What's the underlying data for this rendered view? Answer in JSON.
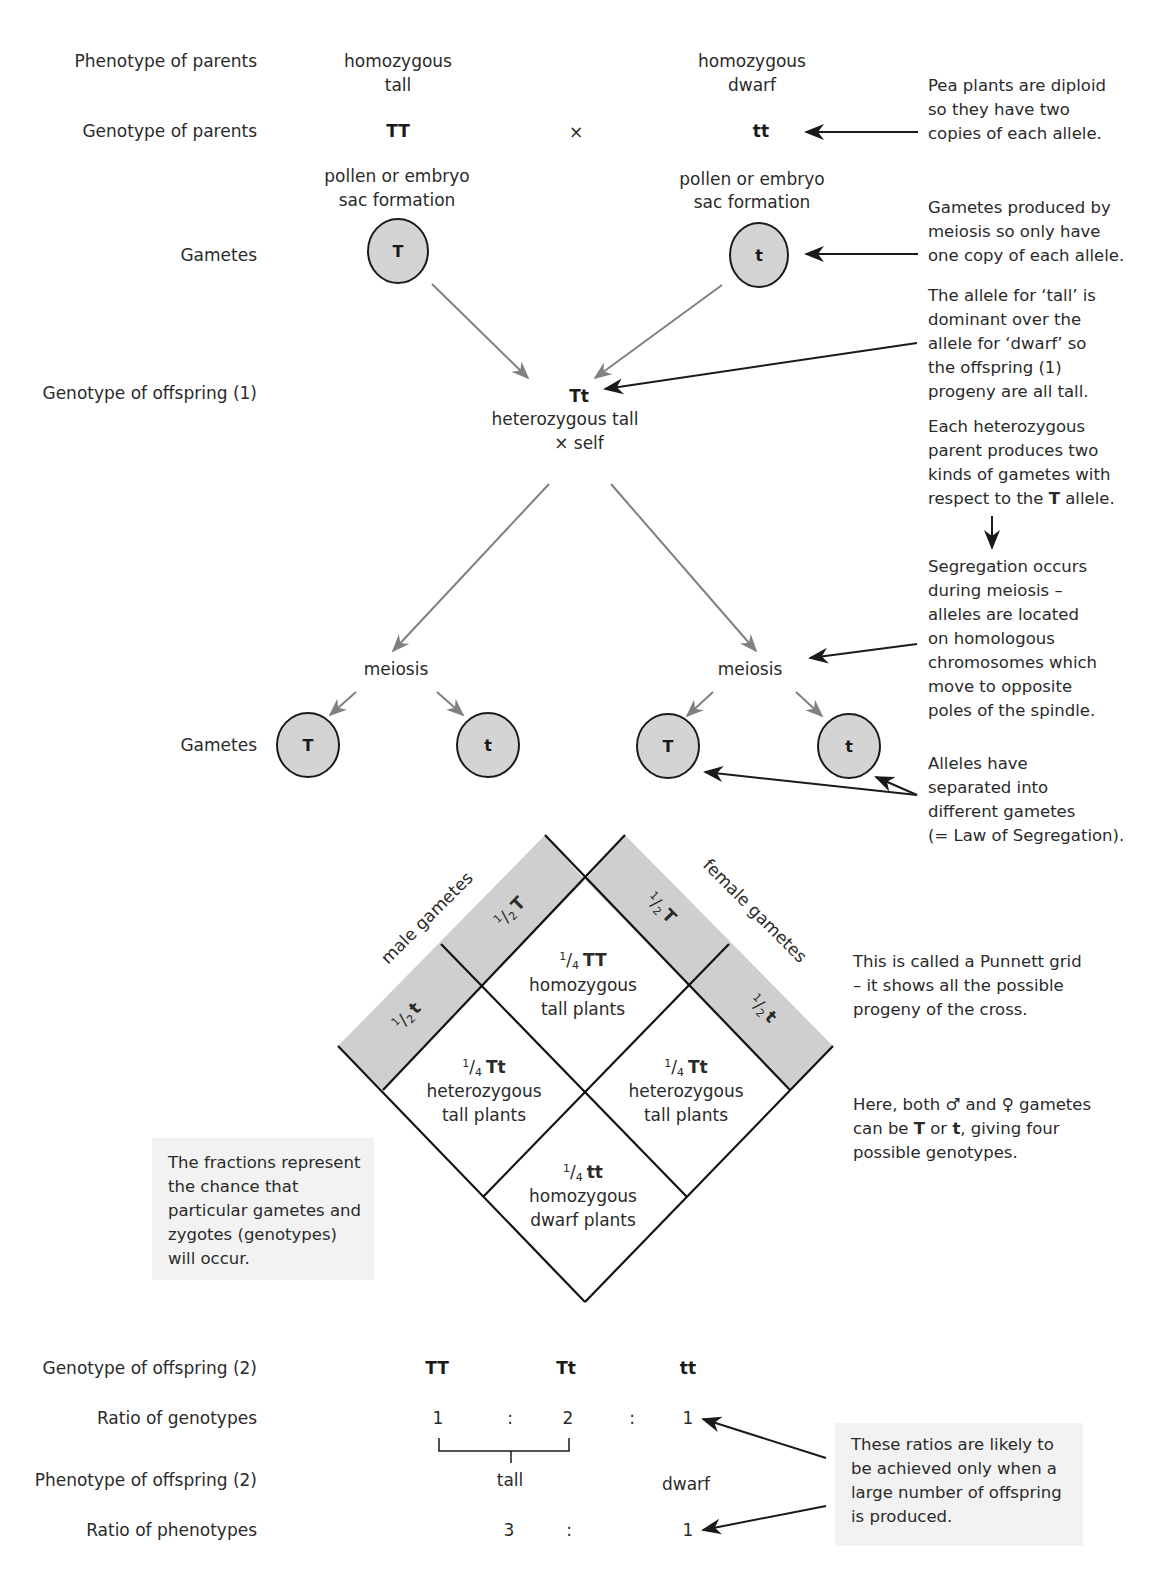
{
  "row_labels": {
    "phenotype_parents": "Phenotype of parents",
    "genotype_parents": "Genotype of parents",
    "gametes_1": "Gametes",
    "genotype_offspring_1": "Genotype of offspring (1)",
    "gametes_2": "Gametes",
    "genotype_offspring_2": "Genotype of offspring (2)",
    "ratio_genotypes": "Ratio of genotypes",
    "phenotype_offspring_2": "Phenotype of offspring (2)",
    "ratio_phenotypes": "Ratio of phenotypes"
  },
  "parents": {
    "left": {
      "phenotype_line1": "homozygous",
      "phenotype_line2": "tall",
      "genotype": "TT",
      "formation_line1": "pollen or embryo",
      "formation_line2": "sac formation",
      "gamete": "T"
    },
    "cross_symbol": "×",
    "right": {
      "phenotype_line1": "homozygous",
      "phenotype_line2": "dwarf",
      "genotype": "tt",
      "formation_line1": "pollen or embryo",
      "formation_line2": "sac formation",
      "gamete": "t"
    }
  },
  "offspring_1": {
    "genotype": "Tt",
    "line1": "heterozygous tall",
    "line2": "× self"
  },
  "meiosis": {
    "left": "meiosis",
    "right": "meiosis"
  },
  "gametes_2": [
    "T",
    "t",
    "T",
    "t"
  ],
  "punnett": {
    "male_label": "male gametes",
    "female_label": "female gametes",
    "half": "1/2",
    "male": [
      {
        "num": "1",
        "den": "2",
        "allele": "T"
      },
      {
        "num": "1",
        "den": "2",
        "allele": "t"
      }
    ],
    "female": [
      {
        "num": "1",
        "den": "2",
        "allele": "T"
      },
      {
        "num": "1",
        "den": "2",
        "allele": "t"
      }
    ],
    "cells": {
      "top": {
        "num": "1",
        "den": "4",
        "genotype": "TT",
        "line1": "homozygous",
        "line2": "tall plants"
      },
      "left": {
        "num": "1",
        "den": "4",
        "genotype": "Tt",
        "line1": "heterozygous",
        "line2": "tall plants"
      },
      "right": {
        "num": "1",
        "den": "4",
        "genotype": "Tt",
        "line1": "heterozygous",
        "line2": "tall plants"
      },
      "bottom": {
        "num": "1",
        "den": "4",
        "genotype": "tt",
        "line1": "homozygous",
        "line2": "dwarf plants"
      }
    }
  },
  "offspring_2": {
    "genotypes": [
      "TT",
      "Tt",
      "tt"
    ],
    "genotype_ratio": [
      "1",
      ":",
      "2",
      ":",
      "1"
    ],
    "phenotypes": [
      "tall",
      "dwarf"
    ],
    "phenotype_ratio": [
      "3",
      ":",
      "1"
    ]
  },
  "notes": {
    "diploid": [
      "Pea plants are diploid",
      "so they have two",
      "copies of each allele."
    ],
    "gametes_meiosis": [
      "Gametes produced by",
      "meiosis so only have",
      "one copy of each allele."
    ],
    "dominant": [
      "The allele for ‘tall’ is",
      "dominant over the",
      "allele for ‘dwarf’ so",
      "the offspring (1)",
      "progeny are all tall."
    ],
    "heterozygous": {
      "line1": "Each heterozygous",
      "line2": "parent produces two",
      "line3": "kinds of gametes with",
      "line4_pre": "respect to the ",
      "line4_bold": "T",
      "line4_post": " allele."
    },
    "segregation": [
      "Segregation occurs",
      "during meiosis –",
      "alleles are located",
      "on homologous",
      "chromosomes which",
      "move to opposite",
      "poles of the spindle."
    ],
    "law": [
      "Alleles have",
      "separated into",
      "different gametes",
      "(= Law of Segregation)."
    ],
    "punnett_grid": [
      "This is called a Punnett grid",
      "– it shows all the possible",
      "progeny of the cross."
    ],
    "both_gametes": {
      "line1_pre": "Here, both ",
      "male_symbol": "♂",
      "line1_mid": " and ",
      "female_symbol": "♀",
      "line1_post": " gametes",
      "line2_pre": "can be ",
      "line2_b1": "T",
      "line2_mid": " or ",
      "line2_b2": "t",
      "line2_post": ", giving four",
      "line3": "possible genotypes."
    },
    "fractions": [
      "The fractions represent",
      "the chance that",
      "particular gametes and",
      "zygotes (genotypes)",
      "will occur."
    ],
    "ratios": [
      "These ratios are likely to",
      "be achieved only when a",
      "large number of offspring",
      "is produced."
    ]
  },
  "colors": {
    "gamete_fill": "#d4d4d4",
    "grid_band": "#cfcfcf",
    "note_box": "#f2f2f2",
    "gray_arrow": "#808080",
    "ink": "#1a1a1a"
  }
}
